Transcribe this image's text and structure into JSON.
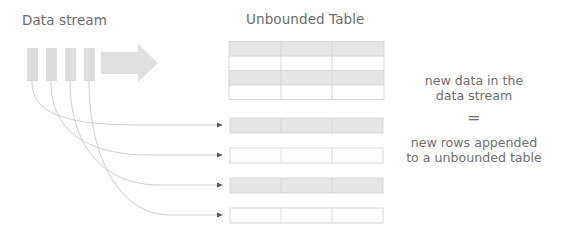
{
  "canvas": {
    "width": 563,
    "height": 242,
    "background": "#ffffff"
  },
  "titles": {
    "data_stream": "Data stream",
    "unbounded_table": "Unbounded Table"
  },
  "notes": {
    "top_line1": "new data in the",
    "top_line2": "data stream",
    "equals": "=",
    "bottom_line1": "new rows appended",
    "bottom_line2": "to a unbounded table"
  },
  "colors": {
    "fill_shaded": "#e2e2e2",
    "fill_light": "#ededed",
    "stroke_table": "#d9d9d9",
    "arrow_big": "#dedede",
    "block": "#dcdcdc",
    "curve": "#c9c9c9",
    "arrowhead": "#5a5a5a",
    "text": "#6e6e6e"
  },
  "stream_blocks": [
    {
      "x": 27,
      "y": 48,
      "width": 11,
      "height": 33
    },
    {
      "x": 46,
      "y": 48,
      "width": 11,
      "height": 33
    },
    {
      "x": 65,
      "y": 48,
      "width": 11,
      "height": 33
    },
    {
      "x": 84,
      "y": 48,
      "width": 11,
      "height": 33
    }
  ],
  "big_arrow": {
    "x": 101,
    "y": 44,
    "width": 57,
    "height": 38
  },
  "unbounded_table": {
    "x": 229,
    "y": 41,
    "width": 155,
    "height": 59,
    "columns": 3,
    "rows": 4,
    "row_fills": [
      "shaded",
      "white",
      "shaded",
      "white"
    ]
  },
  "appended_rows": [
    {
      "x": 230,
      "y": 118,
      "width": 153,
      "height": 15,
      "fill": "shaded"
    },
    {
      "x": 230,
      "y": 148,
      "width": 153,
      "height": 15,
      "fill": "white"
    },
    {
      "x": 230,
      "y": 178,
      "width": 153,
      "height": 15,
      "fill": "shaded"
    },
    {
      "x": 230,
      "y": 208,
      "width": 153,
      "height": 15,
      "fill": "white"
    }
  ],
  "curves": [
    {
      "from_x": 32,
      "from_y": 81,
      "to_x": 226,
      "to_y": 125
    },
    {
      "from_x": 51,
      "from_y": 81,
      "to_x": 226,
      "to_y": 155
    },
    {
      "from_x": 70,
      "from_y": 81,
      "to_x": 226,
      "to_y": 185
    },
    {
      "from_x": 89,
      "from_y": 81,
      "to_x": 226,
      "to_y": 215
    }
  ]
}
